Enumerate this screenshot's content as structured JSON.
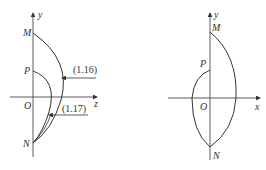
{
  "figures": [
    {
      "id": "left",
      "axes": {
        "horizontal": "z",
        "vertical": "y",
        "origin": "O"
      },
      "points": {
        "top": "M",
        "middle": "P",
        "bottom": "N"
      },
      "annotations": [
        {
          "label": "(1.16)",
          "target": "outer arc M-N"
        },
        {
          "label": "(1.17)",
          "target": "inner arc P-N"
        }
      ]
    },
    {
      "id": "right",
      "axes": {
        "horizontal": "x",
        "vertical": "y",
        "origin": "O"
      },
      "points": {
        "top": "M",
        "middle": "P",
        "bottom": "N"
      }
    }
  ],
  "colors": {
    "stroke": "#333333",
    "background": "#ffffff"
  }
}
